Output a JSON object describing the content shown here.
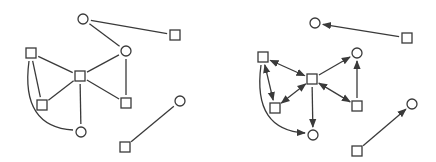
{
  "colors": {
    "stroke": "#3a3a3a",
    "background": "#ffffff",
    "node_fill": "#ffffff"
  },
  "node_size": {
    "circle_r": 5,
    "square_half": 5
  },
  "graphs": [
    {
      "id": "undirected",
      "directed": false,
      "nodes": [
        {
          "id": "A",
          "shape": "circle",
          "x": 83,
          "y": 19
        },
        {
          "id": "B",
          "shape": "square",
          "x": 175,
          "y": 35
        },
        {
          "id": "C",
          "shape": "circle",
          "x": 126,
          "y": 51
        },
        {
          "id": "D",
          "shape": "square",
          "x": 31,
          "y": 53
        },
        {
          "id": "E",
          "shape": "square",
          "x": 80,
          "y": 76
        },
        {
          "id": "F",
          "shape": "square",
          "x": 42,
          "y": 105
        },
        {
          "id": "G",
          "shape": "square",
          "x": 126,
          "y": 103
        },
        {
          "id": "H",
          "shape": "circle",
          "x": 180,
          "y": 101
        },
        {
          "id": "I",
          "shape": "circle",
          "x": 81,
          "y": 132
        },
        {
          "id": "J",
          "shape": "square",
          "x": 125,
          "y": 147
        }
      ],
      "edges": [
        {
          "from": "A",
          "to": "B"
        },
        {
          "from": "A",
          "to": "C"
        },
        {
          "from": "C",
          "to": "E"
        },
        {
          "from": "C",
          "to": "G"
        },
        {
          "from": "D",
          "to": "E"
        },
        {
          "from": "D",
          "to": "F"
        },
        {
          "from": "E",
          "to": "F"
        },
        {
          "from": "E",
          "to": "G"
        },
        {
          "from": "E",
          "to": "I"
        },
        {
          "from": "D",
          "to": "I",
          "curved": true
        },
        {
          "from": "J",
          "to": "H"
        }
      ]
    },
    {
      "id": "directed",
      "directed": true,
      "nodes": [
        {
          "id": "A",
          "shape": "circle",
          "x": 315,
          "y": 23
        },
        {
          "id": "B",
          "shape": "square",
          "x": 407,
          "y": 38
        },
        {
          "id": "C",
          "shape": "circle",
          "x": 357,
          "y": 53
        },
        {
          "id": "D",
          "shape": "square",
          "x": 263,
          "y": 57
        },
        {
          "id": "E",
          "shape": "square",
          "x": 312,
          "y": 79
        },
        {
          "id": "F",
          "shape": "square",
          "x": 275,
          "y": 108
        },
        {
          "id": "G",
          "shape": "square",
          "x": 357,
          "y": 106
        },
        {
          "id": "H",
          "shape": "circle",
          "x": 412,
          "y": 104
        },
        {
          "id": "I",
          "shape": "circle",
          "x": 313,
          "y": 135
        },
        {
          "id": "J",
          "shape": "square",
          "x": 357,
          "y": 151
        }
      ],
      "edges": [
        {
          "from": "B",
          "to": "A",
          "arrow": "end"
        },
        {
          "from": "E",
          "to": "C",
          "arrow": "end"
        },
        {
          "from": "G",
          "to": "C",
          "arrow": "end"
        },
        {
          "from": "D",
          "to": "E",
          "arrow": "both"
        },
        {
          "from": "D",
          "to": "F",
          "arrow": "both"
        },
        {
          "from": "F",
          "to": "E",
          "arrow": "both"
        },
        {
          "from": "E",
          "to": "G",
          "arrow": "both"
        },
        {
          "from": "E",
          "to": "I",
          "arrow": "end"
        },
        {
          "from": "D",
          "to": "I",
          "arrow": "end",
          "curved": true
        },
        {
          "from": "J",
          "to": "H",
          "arrow": "end"
        }
      ]
    }
  ]
}
